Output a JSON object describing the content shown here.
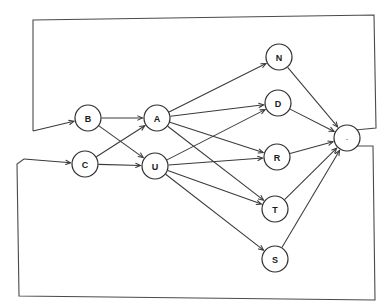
{
  "diagram": {
    "background_color": "#ffffff",
    "stroke_color": "#3a3a3a",
    "node_fill": "#ffffff",
    "node_radius": 13,
    "nodes": [
      {
        "id": "B",
        "label": "B",
        "x": 88,
        "y": 118
      },
      {
        "id": "C",
        "label": "C",
        "x": 85,
        "y": 164
      },
      {
        "id": "A",
        "label": "A",
        "x": 157,
        "y": 118
      },
      {
        "id": "U",
        "label": "U",
        "x": 155,
        "y": 166
      },
      {
        "id": "N",
        "label": "N",
        "x": 279,
        "y": 57
      },
      {
        "id": "D",
        "label": "D",
        "x": 278,
        "y": 103
      },
      {
        "id": "R",
        "label": "R",
        "x": 277,
        "y": 157
      },
      {
        "id": "T",
        "label": "T",
        "x": 275,
        "y": 209
      },
      {
        "id": "S",
        "label": "S",
        "x": 275,
        "y": 259
      },
      {
        "id": "END",
        "label": "-",
        "x": 347,
        "y": 138
      }
    ],
    "edges": [
      {
        "from": "B",
        "to": "A"
      },
      {
        "from": "B",
        "to": "U"
      },
      {
        "from": "C",
        "to": "A"
      },
      {
        "from": "C",
        "to": "U"
      },
      {
        "from": "A",
        "to": "N"
      },
      {
        "from": "A",
        "to": "D"
      },
      {
        "from": "A",
        "to": "R"
      },
      {
        "from": "A",
        "to": "T"
      },
      {
        "from": "U",
        "to": "D"
      },
      {
        "from": "U",
        "to": "R"
      },
      {
        "from": "U",
        "to": "T"
      },
      {
        "from": "U",
        "to": "S"
      },
      {
        "from": "N",
        "to": "END"
      },
      {
        "from": "D",
        "to": "END"
      },
      {
        "from": "R",
        "to": "END"
      },
      {
        "from": "T",
        "to": "END"
      },
      {
        "from": "S",
        "to": "END"
      }
    ],
    "boxes": [
      {
        "id": "top-box",
        "points": "33,131 33,20 374,15 376,128 355,130",
        "entry_target": "B",
        "entry_from_x": 33,
        "entry_from_y": 131,
        "entry_to_x": 72,
        "entry_to_y": 122
      },
      {
        "id": "bottom-box",
        "points": "24,159 17,164 19,296 375,300 373,146 357,146",
        "entry_target": "C",
        "entry_from_x": 24,
        "entry_from_y": 159,
        "entry_to_x": 69,
        "entry_to_y": 163
      }
    ]
  }
}
